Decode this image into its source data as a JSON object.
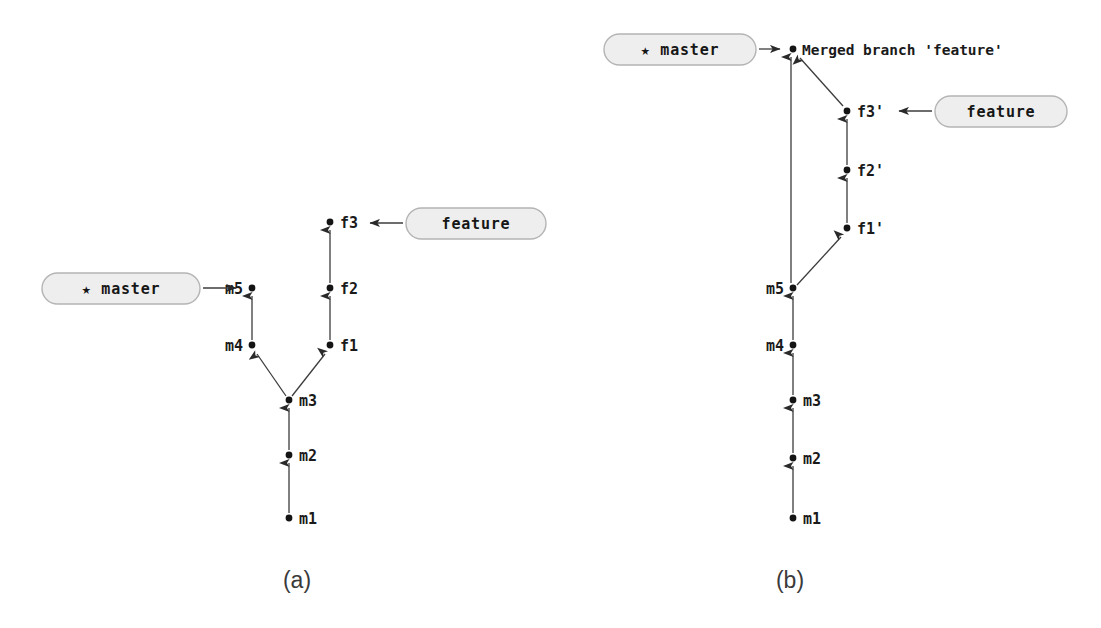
{
  "figure": {
    "background_color": "#ffffff",
    "ink_color": "#2a2a2a",
    "pill_fill_color": "#eeeeee",
    "pill_border_color": "#b4b4b4",
    "captions": [
      {
        "key": "a",
        "label": "(a)",
        "x": 297,
        "y": 588
      },
      {
        "key": "b",
        "label": "(b)",
        "x": 790,
        "y": 588
      }
    ]
  },
  "panel_a": {
    "caption": "(a)",
    "description": "master and feature branches diverged from commit m3",
    "commits": [
      {
        "id": "m1",
        "label": "m1",
        "x": 289,
        "y": 518,
        "label_side": "right"
      },
      {
        "id": "m2",
        "label": "m2",
        "x": 289,
        "y": 455,
        "label_side": "right"
      },
      {
        "id": "m3",
        "label": "m3",
        "x": 289,
        "y": 400,
        "label_side": "right"
      },
      {
        "id": "m4",
        "label": "m4",
        "x": 252,
        "y": 345,
        "label_side": "left"
      },
      {
        "id": "m5",
        "label": "m5",
        "x": 252,
        "y": 288,
        "label_side": "left"
      },
      {
        "id": "f1",
        "label": "f1",
        "x": 330,
        "y": 345,
        "label_side": "right"
      },
      {
        "id": "f2",
        "label": "f2",
        "x": 330,
        "y": 288,
        "label_side": "right"
      },
      {
        "id": "f3",
        "label": "f3",
        "x": 330,
        "y": 222,
        "label_side": "right"
      }
    ],
    "edges": [
      {
        "from": "m1",
        "to": "m2"
      },
      {
        "from": "m2",
        "to": "m3"
      },
      {
        "from": "m3",
        "to": "m4"
      },
      {
        "from": "m4",
        "to": "m5"
      },
      {
        "from": "m3",
        "to": "f1"
      },
      {
        "from": "f1",
        "to": "f2"
      },
      {
        "from": "f2",
        "to": "f3"
      }
    ],
    "refs": [
      {
        "name": "master",
        "label": "★ master",
        "is_current": true,
        "points_to": "m5",
        "pill": {
          "x": 42,
          "y": 273,
          "width": 158,
          "height": 31
        },
        "arrow": {
          "x1": 203,
          "y1": 288,
          "x2": 243,
          "y2": 288,
          "direction": "right"
        }
      },
      {
        "name": "feature",
        "label": "feature",
        "is_current": false,
        "points_to": "f3",
        "pill": {
          "x": 406,
          "y": 208,
          "width": 140,
          "height": 31
        },
        "arrow": {
          "x1": 403,
          "y1": 223,
          "x2": 364,
          "y2": 223,
          "direction": "left"
        }
      }
    ]
  },
  "panel_b": {
    "caption": "(b)",
    "description": "feature branch rebased onto m5 and merged into master",
    "commits": [
      {
        "id": "m1",
        "label": "m1",
        "x": 793,
        "y": 518,
        "label_side": "right"
      },
      {
        "id": "m2",
        "label": "m2",
        "x": 793,
        "y": 458,
        "label_side": "right"
      },
      {
        "id": "m3",
        "label": "m3",
        "x": 793,
        "y": 400,
        "label_side": "right"
      },
      {
        "id": "m4",
        "label": "m4",
        "x": 793,
        "y": 345,
        "label_side": "left"
      },
      {
        "id": "m5",
        "label": "m5",
        "x": 793,
        "y": 288,
        "label_side": "left"
      },
      {
        "id": "f1p",
        "label": "f1'",
        "x": 847,
        "y": 228,
        "label_side": "right"
      },
      {
        "id": "f2p",
        "label": "f2'",
        "x": 847,
        "y": 170,
        "label_side": "right"
      },
      {
        "id": "f3p",
        "label": "f3'",
        "x": 847,
        "y": 111,
        "label_side": "right"
      },
      {
        "id": "merge",
        "label": "Merged branch 'feature'",
        "x": 793,
        "y": 49,
        "label_side": "right"
      }
    ],
    "edges": [
      {
        "from": "m1",
        "to": "m2"
      },
      {
        "from": "m2",
        "to": "m3"
      },
      {
        "from": "m3",
        "to": "m4"
      },
      {
        "from": "m4",
        "to": "m5"
      },
      {
        "from": "m5",
        "to": "merge"
      },
      {
        "from": "m5",
        "to": "f1p"
      },
      {
        "from": "f1p",
        "to": "f2p"
      },
      {
        "from": "f2p",
        "to": "f3p"
      },
      {
        "from": "f3p",
        "to": "merge"
      }
    ],
    "refs": [
      {
        "name": "master",
        "label": "★ master",
        "is_current": true,
        "points_to": "merge",
        "pill": {
          "x": 604,
          "y": 34,
          "width": 152,
          "height": 31
        },
        "arrow": {
          "x1": 759,
          "y1": 49,
          "x2": 786,
          "y2": 49,
          "direction": "right"
        }
      },
      {
        "name": "feature",
        "label": "feature",
        "is_current": false,
        "points_to": "f3'",
        "pill": {
          "x": 935,
          "y": 96,
          "width": 132,
          "height": 31
        },
        "arrow": {
          "x1": 932,
          "y1": 111,
          "x2": 893,
          "y2": 111,
          "direction": "left"
        }
      }
    ]
  }
}
